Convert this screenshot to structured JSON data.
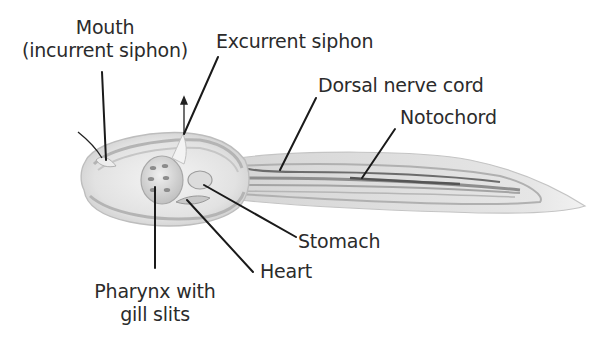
{
  "diagram": {
    "colors": {
      "background": "#ffffff",
      "body_fill": "#e4e4e4",
      "body_outline": "#bdbdbd",
      "band_dark": "#8a8a8a",
      "leader_line": "#1a1a1a",
      "text": "#2b2b2b"
    },
    "labels": {
      "mouth": {
        "line1": "Mouth",
        "line2": "(incurrent siphon)"
      },
      "excurrent_siphon": "Excurrent siphon",
      "dorsal_nerve_cord": "Dorsal nerve cord",
      "notochord": "Notochord",
      "stomach": "Stomach",
      "heart": "Heart",
      "pharynx": {
        "line1": "Pharynx with",
        "line2": "gill slits"
      }
    }
  }
}
